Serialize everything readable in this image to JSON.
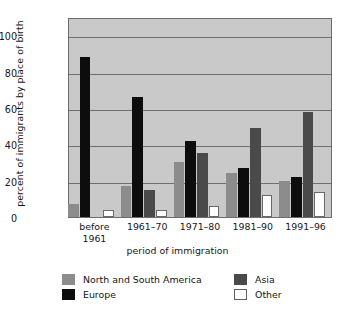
{
  "chart_data": {
    "type": "bar",
    "title": "",
    "xlabel": "period of immigration",
    "ylabel": "percent of immigrants by place of birth",
    "ylim": [
      0,
      110
    ],
    "yticks": [
      0,
      20,
      40,
      60,
      80,
      100
    ],
    "grid": true,
    "legend_position": "bottom",
    "categories": [
      "before 1961",
      "1961–70",
      "1971–80",
      "1981–90",
      "1991–96"
    ],
    "category_lines": [
      [
        "before",
        "1961"
      ],
      [
        "1961–70",
        ""
      ],
      [
        "1971–80",
        ""
      ],
      [
        "1981–90",
        ""
      ],
      [
        "1991–96",
        ""
      ]
    ],
    "series": [
      {
        "name": "North and South America",
        "color": "#8c8c8c",
        "values": [
          7,
          17,
          30,
          24,
          20
        ]
      },
      {
        "name": "Europe",
        "color": "#0d0d0d",
        "values": [
          88,
          66,
          42,
          27,
          22
        ]
      },
      {
        "name": "Asia",
        "color": "#4a4a4a",
        "values": [
          0,
          15,
          35,
          49,
          58
        ]
      },
      {
        "name": "Other",
        "color": "#ffffff",
        "values": [
          4,
          4,
          6,
          12,
          14
        ]
      }
    ]
  },
  "axis": {
    "y_title": "percent of immigrants by place of birth",
    "x_title": "period of immigration",
    "y_tick_labels": [
      "100",
      "80",
      "60",
      "40",
      "20",
      "0"
    ]
  },
  "legend": {
    "items": [
      {
        "label": "North and South America",
        "swatch": "americas"
      },
      {
        "label": "Asia",
        "swatch": "asia"
      },
      {
        "label": "Europe",
        "swatch": "europe"
      },
      {
        "label": "Other",
        "swatch": "other"
      }
    ]
  },
  "colors": {
    "plot_background": "#c9c9c9",
    "gridline": "#6f6f6f",
    "frame": "#6d6d6d",
    "americas": "#8c8c8c",
    "europe": "#0d0d0d",
    "asia": "#4a4a4a",
    "other": "#ffffff"
  }
}
